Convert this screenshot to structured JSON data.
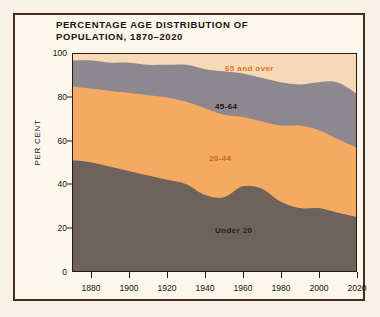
{
  "title": "PERCENTAGE AGE DISTRIBUTION OF\nPOPULATION, 1870–2020",
  "axes": {
    "ylabel": "PER CENT",
    "yticks": [
      "0",
      "20",
      "40",
      "60",
      "80",
      "100"
    ],
    "xticks": [
      "1880",
      "1900",
      "1920",
      "1940",
      "1960",
      "1980",
      "2000",
      "2020"
    ]
  },
  "band_labels": {
    "over65": "65 and over",
    "a45_64": "45-64",
    "a20_44": "20-44",
    "under20": "Under 20"
  },
  "colors": {
    "over65": "#f7d9b5",
    "a45_64": "#8d8790",
    "a20_44": "#f5aa61",
    "under20": "#6e625c",
    "frame": "#4a2a20",
    "paper": "#fbf7ec",
    "ink": "#1b1208",
    "label_orange": "#e0762c"
  },
  "chart_data": {
    "type": "area",
    "title": "PERCENTAGE AGE DISTRIBUTION OF POPULATION, 1870–2020",
    "xlabel": "",
    "ylabel": "PER CENT",
    "xlim": [
      1870,
      2020
    ],
    "ylim": [
      0,
      100
    ],
    "stacked": true,
    "grid": false,
    "legend": "in-plot band labels",
    "x": [
      1870,
      1880,
      1890,
      1900,
      1910,
      1920,
      1930,
      1940,
      1950,
      1960,
      1970,
      1980,
      1990,
      2000,
      2010,
      2020
    ],
    "series": [
      {
        "name": "Under 20",
        "values": [
          51,
          50,
          48,
          46,
          44,
          42,
          40,
          35,
          34,
          39,
          38,
          32,
          29,
          29,
          27,
          25
        ]
      },
      {
        "name": "20-44",
        "values": [
          34,
          34,
          35,
          36,
          37,
          38,
          38,
          40,
          38,
          32,
          31,
          35,
          38,
          36,
          34,
          32
        ]
      },
      {
        "name": "45-64",
        "values": [
          12,
          13,
          13,
          14,
          14,
          15,
          17,
          18,
          20,
          20,
          20,
          20,
          19,
          22,
          26,
          25
        ]
      },
      {
        "name": "65 and over",
        "values": [
          3,
          3,
          4,
          4,
          5,
          5,
          5,
          7,
          8,
          9,
          11,
          13,
          14,
          13,
          13,
          18
        ]
      }
    ],
    "cumulative_top_boundaries": {
      "under20_top": [
        51,
        50,
        48,
        46,
        44,
        42,
        40,
        35,
        34,
        39,
        38,
        32,
        29,
        29,
        27,
        25
      ],
      "a20_44_top": [
        85,
        84,
        83,
        82,
        81,
        80,
        78,
        75,
        72,
        71,
        69,
        67,
        67,
        65,
        61,
        57
      ],
      "a45_64_top": [
        97,
        97,
        96,
        96,
        95,
        95,
        95,
        93,
        92,
        91,
        89,
        87,
        86,
        87,
        87,
        82
      ]
    }
  }
}
